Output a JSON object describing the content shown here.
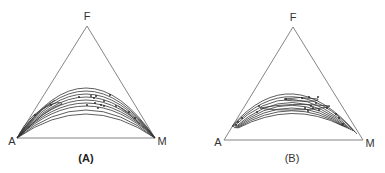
{
  "figure": {
    "panels": [
      {
        "id": "A",
        "caption": "(A)",
        "vertices": {
          "top": "F",
          "left": "A",
          "right": "M"
        },
        "description": "Ternary diagram with nested arc-shaped contour curves converging at vertices A and M"
      },
      {
        "id": "B",
        "caption": "(B)",
        "vertices": {
          "top": "F",
          "left": "A",
          "right": "M"
        },
        "description": "Ternary diagram with nested arc-shaped contour curves and closed inner loops, ending near the lower triangle edges"
      }
    ]
  },
  "colors": {
    "triangle": "#777777",
    "curves": "#333333",
    "text": "#333333"
  }
}
